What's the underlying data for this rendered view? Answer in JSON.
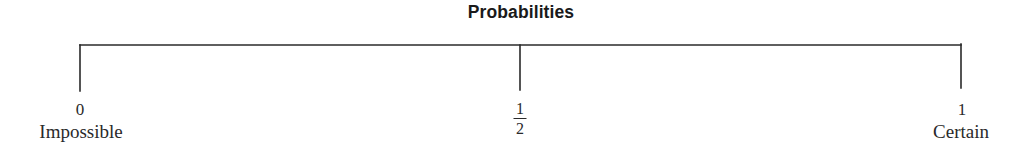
{
  "title": "Probabilities",
  "scale": {
    "stroke_color": "#2a2a2a",
    "markers": [
      {
        "value": "0",
        "description": "Impossible"
      },
      {
        "numerator": "1",
        "denominator": "2",
        "value": "1/2",
        "description": ""
      },
      {
        "value": "1",
        "description": "Certain"
      }
    ]
  }
}
